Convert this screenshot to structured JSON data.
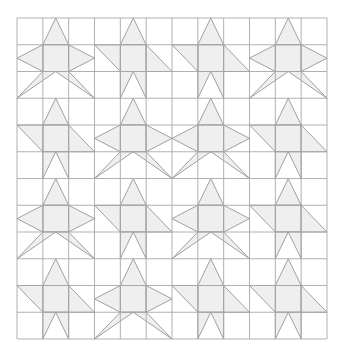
{
  "figure": {
    "title": "",
    "colors": {
      "background": "#ffffff",
      "grid": "#a8a8a8",
      "fill": "#efefef",
      "outline": "#8a8a8a"
    },
    "grid": {
      "x0": 17,
      "y0": 18,
      "x1": 327,
      "y1": 339,
      "cols": 12,
      "rows": 12
    },
    "block_types": {
      "star": "five-point star: top point, center square, side kites, two bottom legs",
      "diag": "star variant: top point, center square, diagonal side arms, notched base"
    },
    "blocks": [
      [
        "star",
        "diag",
        "diag",
        "star"
      ],
      [
        "diag",
        "star",
        "star",
        "diag"
      ],
      [
        "star",
        "diag",
        "star",
        "diag"
      ],
      [
        "diag",
        "star",
        "diag",
        "diag"
      ]
    ]
  }
}
